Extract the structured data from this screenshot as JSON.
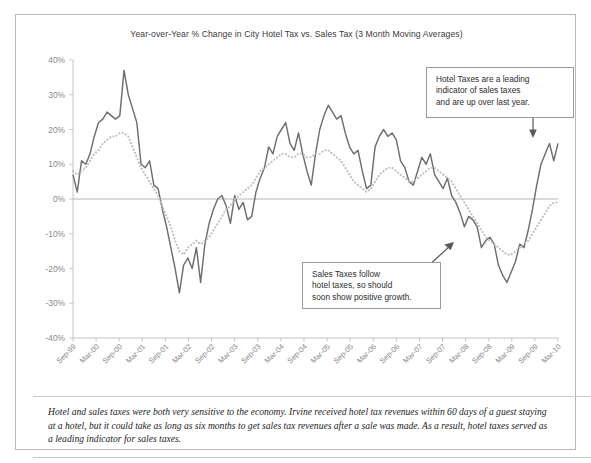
{
  "chart_data": {
    "type": "line",
    "title": "Year-over-Year % Change in City Hotel Tax vs. Sales Tax (3 Month Moving Averages)",
    "xlabel": "",
    "ylabel": "",
    "ylim": [
      -40,
      40
    ],
    "ytick_values": [
      40,
      30,
      20,
      10,
      0,
      -10,
      -20,
      -30,
      -40
    ],
    "ytick_labels": [
      "40%",
      "30%",
      "20%",
      "10%",
      "0%",
      "-10%",
      "-20%",
      "-30%",
      "-40%"
    ],
    "grid": false,
    "zero_line": true,
    "legend_position": "none",
    "x_tick_labels": [
      "Sep-99",
      "Mar-00",
      "Sep-00",
      "Mar-01",
      "Sep-01",
      "Mar-02",
      "Sep-02",
      "Mar-03",
      "Sep-03",
      "Mar-04",
      "Sep-04",
      "Mar-05",
      "Sep-05",
      "Mar-06",
      "Sep-06",
      "Mar-07",
      "Sep-07",
      "Mar-08",
      "Sep-08",
      "Mar-09",
      "Sep-09",
      "Mar-10"
    ],
    "x_tick_label_rotation": 45,
    "series": [
      {
        "name": "Hotel Tax",
        "style": "solid",
        "color": "#6e6e6e",
        "values": [
          7,
          2,
          11,
          10,
          13,
          18,
          22,
          23,
          25,
          24,
          23,
          24,
          37,
          30,
          26,
          22,
          10,
          9,
          11,
          4,
          3,
          -3,
          -8,
          -14,
          -20,
          -27,
          -19,
          -17,
          -20,
          -14,
          -24,
          -13,
          -7,
          -3,
          0,
          1,
          -2,
          -7,
          1,
          -3,
          -1,
          -6,
          -5,
          2,
          6,
          9,
          15,
          13,
          18,
          20,
          22,
          16,
          14,
          19,
          13,
          8,
          4,
          13,
          20,
          24,
          27,
          25,
          23,
          24,
          19,
          15,
          13,
          14,
          8,
          3,
          4,
          15,
          18,
          20,
          18,
          19,
          17,
          11,
          9,
          5,
          4,
          8,
          12,
          10,
          13,
          7,
          5,
          3,
          6,
          1,
          -1,
          -4,
          -8,
          -5,
          -6,
          -8,
          -14,
          -12,
          -11,
          -13,
          -19,
          -22,
          -24,
          -21,
          -18,
          -13,
          -14,
          -9,
          -3,
          4,
          10,
          13,
          16,
          11,
          16
        ]
      },
      {
        "name": "Sales Tax",
        "style": "dotted",
        "color": "#bfbfbf",
        "values": [
          8,
          7,
          8,
          9,
          11,
          13,
          14,
          16,
          17,
          18,
          18,
          19,
          19,
          18,
          15,
          12,
          9,
          7,
          5,
          3,
          1,
          -2,
          -5,
          -8,
          -12,
          -15,
          -16,
          -14,
          -13,
          -12,
          -13,
          -12,
          -11,
          -9,
          -7,
          -5,
          -3,
          -2,
          0,
          1,
          2,
          3,
          4,
          6,
          8,
          9,
          10,
          11,
          12,
          13,
          13,
          12,
          12,
          13,
          13,
          12,
          12,
          13,
          13,
          14,
          14,
          13,
          12,
          11,
          9,
          7,
          5,
          4,
          3,
          2,
          3,
          5,
          7,
          8,
          9,
          9,
          8,
          7,
          6,
          5,
          5,
          6,
          7,
          8,
          9,
          9,
          8,
          7,
          6,
          5,
          3,
          1,
          -1,
          -3,
          -5,
          -7,
          -9,
          -11,
          -12,
          -13,
          -14,
          -15,
          -16,
          -16,
          -15,
          -14,
          -13,
          -12,
          -10,
          -8,
          -6,
          -4,
          -2,
          -1,
          -1
        ]
      }
    ],
    "annotations": [
      {
        "name": "hotel-tax-callout",
        "lines": [
          "Hotel Taxes are a leading",
          "indicator of sales taxes",
          "and are up over last year."
        ],
        "arrow": "down"
      },
      {
        "name": "sales-tax-callout",
        "lines": [
          "Sales Taxes follow",
          "hotel taxes, so should",
          "soon show positive growth."
        ],
        "arrow": "up-right"
      }
    ]
  },
  "caption": "Hotel and sales taxes were both very sensitive to the economy. Irvine received hotel tax revenues within 60 days of a guest staying at a hotel, but it could take as long as six months to get sales tax revenues after a sale was made. As a result, hotel taxes served as a leading indicator for sales taxes."
}
